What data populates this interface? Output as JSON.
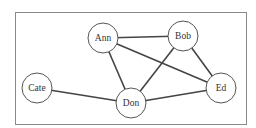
{
  "diagram": {
    "type": "undirected-graph",
    "nodes": [
      {
        "id": "ann",
        "label": "Ann",
        "x": 103,
        "y": 38
      },
      {
        "id": "bob",
        "label": "Bob",
        "x": 183,
        "y": 36
      },
      {
        "id": "cate",
        "label": "Cate",
        "x": 37,
        "y": 88
      },
      {
        "id": "don",
        "label": "Don",
        "x": 131,
        "y": 103
      },
      {
        "id": "ed",
        "label": "Ed",
        "x": 221,
        "y": 88
      }
    ],
    "edges": [
      [
        "Ann",
        "Bob"
      ],
      [
        "Ann",
        "Ed"
      ],
      [
        "Ann",
        "Don"
      ],
      [
        "Bob",
        "Don"
      ],
      [
        "Bob",
        "Ed"
      ],
      [
        "Cate",
        "Don"
      ],
      [
        "Don",
        "Ed"
      ]
    ]
  }
}
